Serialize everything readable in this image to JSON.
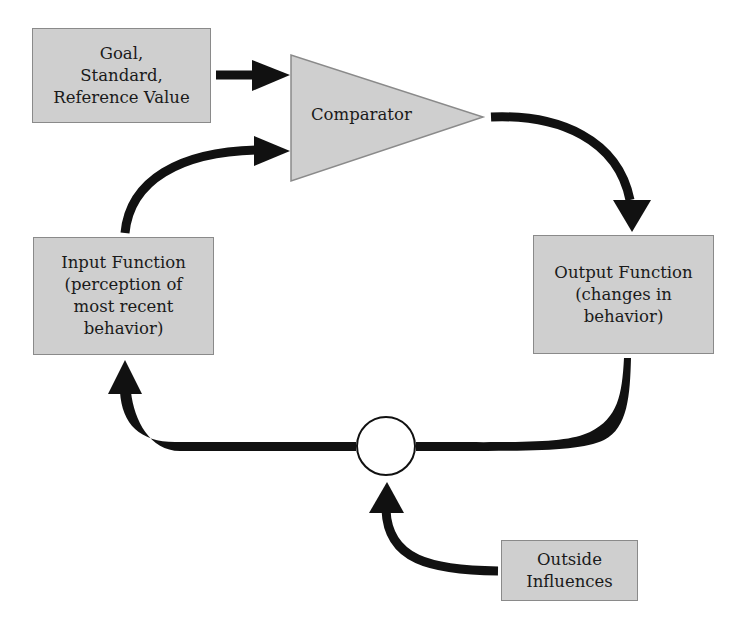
{
  "diagram": {
    "type": "feedback-loop",
    "colors": {
      "box_fill": "#cfcfcf",
      "box_border": "#8a8a8a",
      "arrow": "#111111",
      "circle_fill": "#ffffff",
      "circle_stroke": "#111111",
      "background": "#ffffff"
    },
    "nodes": {
      "goal": {
        "lines": [
          "Goal,",
          "Standard,",
          "Reference Value"
        ]
      },
      "comparator": {
        "label": "Comparator"
      },
      "output": {
        "lines": [
          "Output Function",
          "(changes in",
          "behavior)"
        ]
      },
      "input": {
        "lines": [
          "Input Function",
          "(perception of",
          "most recent",
          "behavior)"
        ]
      },
      "summing_junction": {
        "label": ""
      },
      "outside": {
        "lines": [
          "Outside",
          "Influences"
        ]
      }
    },
    "edges": [
      {
        "from": "goal",
        "to": "comparator"
      },
      {
        "from": "input",
        "to": "comparator"
      },
      {
        "from": "comparator",
        "to": "output"
      },
      {
        "from": "output",
        "to": "summing_junction"
      },
      {
        "from": "summing_junction",
        "to": "input"
      },
      {
        "from": "outside",
        "to": "summing_junction"
      }
    ]
  }
}
